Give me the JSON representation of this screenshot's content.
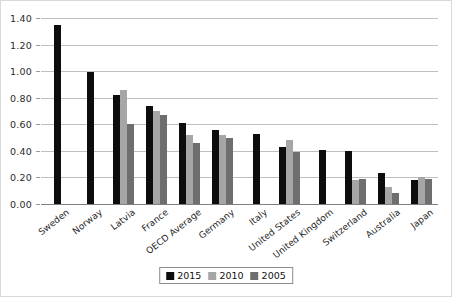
{
  "chart_data": {
    "type": "bar",
    "title": "",
    "xlabel": "",
    "ylabel": "",
    "ylim": [
      0,
      1.4
    ],
    "ytick_step": 0.2,
    "yticks": [
      "0.00",
      "0.20",
      "0.40",
      "0.60",
      "0.80",
      "1.00",
      "1.20",
      "1.40"
    ],
    "ytick_values": [
      0.0,
      0.2,
      0.4,
      0.6,
      0.8,
      1.0,
      1.2,
      1.4
    ],
    "grid": true,
    "legend_position": "bottom-center",
    "categories": [
      "Sweden",
      "Norway",
      "Latvia",
      "France",
      "OECD Average",
      "Germany",
      "Italy",
      "United States",
      "United Kingdom",
      "Switzerland",
      "Australia",
      "Japan"
    ],
    "series": [
      {
        "name": "2015",
        "color": "#0d0d0d",
        "values": [
          1.35,
          0.99,
          0.82,
          0.74,
          0.61,
          0.56,
          0.53,
          0.43,
          0.41,
          0.4,
          0.23,
          0.18
        ]
      },
      {
        "name": "2010",
        "color": "#a6a6a6",
        "values": [
          null,
          null,
          0.86,
          0.7,
          0.52,
          0.52,
          null,
          0.48,
          null,
          0.18,
          0.13,
          0.2
        ]
      },
      {
        "name": "2005",
        "color": "#6e6e6e",
        "values": [
          null,
          null,
          0.6,
          0.67,
          0.46,
          0.5,
          null,
          0.39,
          null,
          0.19,
          0.08,
          0.19
        ]
      }
    ]
  },
  "legend": {
    "entries": [
      {
        "label": "2015",
        "color": "#0d0d0d"
      },
      {
        "label": "2010",
        "color": "#a6a6a6"
      },
      {
        "label": "2005",
        "color": "#6e6e6e"
      }
    ]
  },
  "colors": {
    "series_2015": "#0d0d0d",
    "series_2010": "#a6a6a6",
    "series_2005": "#6e6e6e",
    "gridline": "#bfbfbf",
    "axis": "#808080",
    "background": "#ffffff",
    "frame_border": "#d9d9d9"
  }
}
